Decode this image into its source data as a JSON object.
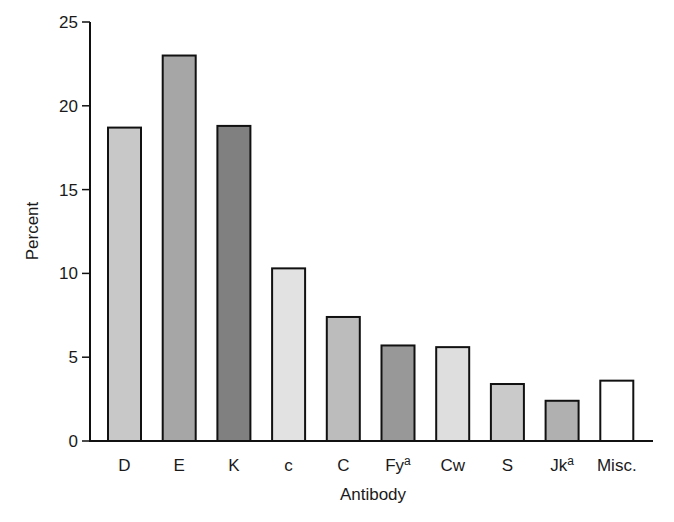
{
  "chart_data": {
    "type": "bar",
    "title": "",
    "xlabel": "Antibody",
    "ylabel": "Percent",
    "ylim": [
      0,
      25
    ],
    "yticks": [
      0,
      5,
      10,
      15,
      20,
      25
    ],
    "grid": false,
    "legend": null,
    "categories": [
      {
        "label": "D",
        "sup": ""
      },
      {
        "label": "E",
        "sup": ""
      },
      {
        "label": "K",
        "sup": ""
      },
      {
        "label": "c",
        "sup": ""
      },
      {
        "label": "C",
        "sup": ""
      },
      {
        "label": "Fy",
        "sup": "a"
      },
      {
        "label": "Cw",
        "sup": ""
      },
      {
        "label": "S",
        "sup": ""
      },
      {
        "label": "Jk",
        "sup": "a"
      },
      {
        "label": "Misc.",
        "sup": ""
      }
    ],
    "values": [
      18.7,
      23.0,
      18.8,
      10.3,
      7.4,
      5.7,
      5.6,
      3.4,
      2.4,
      3.6
    ],
    "colors": [
      "#c8c8c8",
      "#a6a6a6",
      "#808080",
      "#e2e2e2",
      "#bcbcbc",
      "#989898",
      "#dedede",
      "#cacaca",
      "#b0b0b0",
      "#ffffff"
    ]
  }
}
